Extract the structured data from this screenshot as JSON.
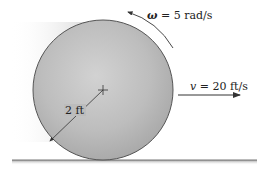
{
  "figure": {
    "type": "rolling-disk",
    "angular_velocity": {
      "symbol": "ω",
      "equals": " = ",
      "value": "5 rad/s"
    },
    "velocity": {
      "symbol": "v",
      "equals": " = ",
      "value": "20 ft/s"
    },
    "radius_label": "2 ft",
    "colors": {
      "disk": "#b8b8b8",
      "disk_edge": "#555555",
      "ground": "#888888",
      "arrow": "#333333",
      "text": "#222222"
    }
  }
}
